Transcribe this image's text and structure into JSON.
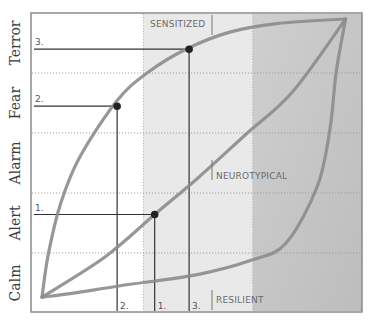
{
  "chart_data": {
    "type": "line",
    "title": "",
    "xlabel": "",
    "ylabel": "",
    "y_levels": [
      "Calm",
      "Alert",
      "Alarm",
      "Fear",
      "Terror"
    ],
    "ylim": [
      0,
      5
    ],
    "xlim": [
      0,
      1
    ],
    "grid": true,
    "shaded_regions": [
      {
        "x_from": 0.34,
        "x_to": 0.67,
        "shade": "light"
      },
      {
        "x_from": 0.67,
        "x_to": 1.0,
        "shade": "dark"
      }
    ],
    "series": [
      {
        "name": "SENSITIZED",
        "points": [
          [
            0.0,
            0.05
          ],
          [
            0.02,
            0.8
          ],
          [
            0.06,
            1.7
          ],
          [
            0.12,
            2.5
          ],
          [
            0.24,
            3.5
          ],
          [
            0.34,
            4.0
          ],
          [
            0.46,
            4.4
          ],
          [
            0.6,
            4.7
          ],
          [
            0.75,
            4.85
          ],
          [
            0.97,
            4.93
          ]
        ]
      },
      {
        "name": "NEUROTYPICAL",
        "points": [
          [
            0.0,
            0.05
          ],
          [
            0.2,
            0.75
          ],
          [
            0.36,
            1.5
          ],
          [
            0.5,
            2.15
          ],
          [
            0.65,
            2.9
          ],
          [
            0.8,
            3.65
          ],
          [
            0.97,
            4.93
          ]
        ]
      },
      {
        "name": "RESILIENT",
        "points": [
          [
            0.0,
            0.05
          ],
          [
            0.1,
            0.12
          ],
          [
            0.25,
            0.25
          ],
          [
            0.5,
            0.45
          ],
          [
            0.67,
            0.7
          ],
          [
            0.78,
            1.0
          ],
          [
            0.88,
            2.0
          ],
          [
            0.92,
            3.0
          ],
          [
            0.94,
            4.0
          ],
          [
            0.97,
            4.93
          ]
        ]
      }
    ],
    "markers": [
      {
        "label": "1.",
        "x": 0.36,
        "y": 1.5,
        "series": "NEUROTYPICAL"
      },
      {
        "label": "2.",
        "x": 0.24,
        "y": 3.4,
        "series": "SENSITIZED"
      },
      {
        "label": "3.",
        "x": 0.47,
        "y": 4.4,
        "series": "SENSITIZED"
      }
    ],
    "annotations": [
      "SENSITIZED",
      "NEUROTYPICAL",
      "RESILIENT"
    ]
  }
}
